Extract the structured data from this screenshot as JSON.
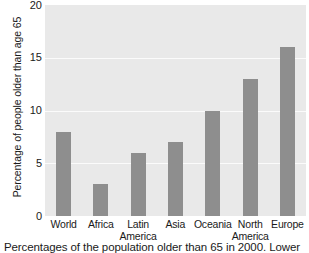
{
  "chart_data": {
    "type": "bar",
    "title": "",
    "xlabel": "",
    "ylabel": "Percentage of people older than age 65",
    "categories": [
      "World",
      "Africa",
      "Latin America",
      "Asia",
      "Oceania",
      "North America",
      "Europe"
    ],
    "category_lines": [
      [
        "World"
      ],
      [
        "Africa"
      ],
      [
        "Latin",
        "America"
      ],
      [
        "Asia"
      ],
      [
        "Oceania"
      ],
      [
        "North",
        "America"
      ],
      [
        "Europe"
      ]
    ],
    "values": [
      8,
      3,
      6,
      7,
      10,
      13,
      16
    ],
    "ylim": [
      0,
      20
    ],
    "yticks": [
      0,
      5,
      10,
      15,
      20
    ],
    "ytick_labels": [
      "0",
      "5",
      "10",
      "15",
      "20"
    ],
    "grid": true,
    "grid_axis": "y",
    "legend": false,
    "legend_position": "none",
    "bar_color": "#8e8e8e",
    "plot_background": "#e9e9e9",
    "gridline_color": "#fbfbfb",
    "figure_background": "#ffffff"
  },
  "caption": {
    "text": "Percentages of the population older than 65 in 2000. Lower"
  }
}
